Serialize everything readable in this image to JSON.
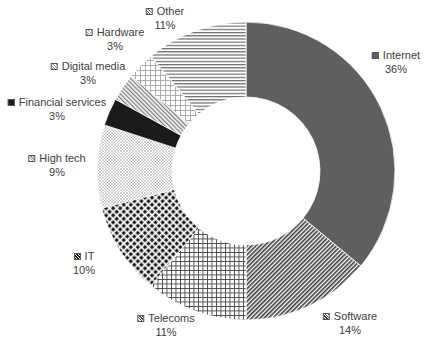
{
  "chart_data": {
    "type": "pie",
    "variant": "donut",
    "title": "",
    "center": [
      246,
      171
    ],
    "outer_radius": 149,
    "inner_radius": 74,
    "start_angle_deg": 0,
    "direction": "clockwise",
    "legend_position": "data labels outside slices",
    "categories": [
      "Internet",
      "Software",
      "Telecoms",
      "IT",
      "High tech",
      "Financial services",
      "Digital media",
      "Hardware",
      "Other"
    ],
    "values": [
      36,
      14,
      11,
      10,
      9,
      3,
      3,
      3,
      11
    ],
    "unit": "%",
    "slices": [
      {
        "name": "Internet",
        "value": 36,
        "label": "Internet",
        "pct": "36%",
        "pattern": "solid",
        "color": "#5f5f5f",
        "label_pos": [
          396,
          55
        ]
      },
      {
        "name": "Software",
        "value": 14,
        "label": "Software",
        "pct": "14%",
        "pattern": "diagonal-dense",
        "color": "#3a3a3a",
        "label_pos": [
          350,
          316
        ]
      },
      {
        "name": "Telecoms",
        "value": 11,
        "label": "Telecoms",
        "pct": "11%",
        "pattern": "grid",
        "color": "#4a4a4a",
        "label_pos": [
          166,
          318
        ]
      },
      {
        "name": "IT",
        "value": 10,
        "label": "IT",
        "pct": "10%",
        "pattern": "dots-bold",
        "color": "#111111",
        "label_pos": [
          84,
          256
        ]
      },
      {
        "name": "High tech",
        "value": 9,
        "label": "High tech",
        "pct": "9%",
        "pattern": "dots-light",
        "color": "#9a9a9a",
        "label_pos": [
          57,
          158
        ]
      },
      {
        "name": "Financial services",
        "value": 3,
        "label": "Financial services",
        "pct": "3%",
        "pattern": "solid",
        "color": "#1a1a1a",
        "label_pos": [
          57,
          102
        ]
      },
      {
        "name": "Digital media",
        "value": 3,
        "label": "Digital media",
        "pct": "3%",
        "pattern": "diagonal-light",
        "color": "#8a8a8a",
        "label_pos": [
          88,
          66
        ]
      },
      {
        "name": "Hardware",
        "value": 3,
        "label": "Hardware",
        "pct": "3%",
        "pattern": "grid-light",
        "color": "#9a9a9a",
        "label_pos": [
          115,
          32
        ]
      },
      {
        "name": "Other",
        "value": 11,
        "label": "Other",
        "pct": "11%",
        "pattern": "horizontal",
        "color": "#6a6a6a",
        "label_pos": [
          165,
          11
        ]
      }
    ]
  }
}
